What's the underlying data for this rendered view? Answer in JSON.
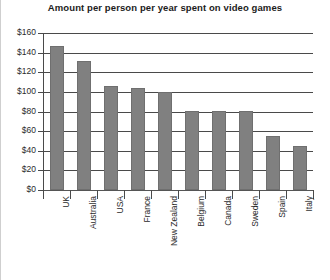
{
  "chart_data": {
    "type": "bar",
    "title": "Amount per person per year spent on video games",
    "xlabel": "",
    "ylabel": "",
    "ylim": [
      0,
      160
    ],
    "ytick_step": 20,
    "grid": true,
    "legend": false,
    "legend_position": "none",
    "currency_prefix": "$",
    "categories": [
      "UK",
      "Australia",
      "USA",
      "France",
      "New Zealand",
      "Belgium",
      "Canada",
      "Sweden",
      "Spain",
      "Italy"
    ],
    "values": [
      147,
      131,
      106,
      104,
      100,
      80,
      80,
      80,
      55,
      45
    ],
    "ytick_labels": [
      "$160",
      "$140",
      "$120",
      "$100",
      "$80",
      "$60",
      "$40",
      "$20",
      "$0"
    ],
    "ytick_values": [
      160,
      140,
      120,
      100,
      80,
      60,
      40,
      20,
      0
    ],
    "bar_color": "#808080",
    "axis_color": "#4a4a4a",
    "text_color": "#2b2b2b",
    "background_color": "#ffffff"
  }
}
